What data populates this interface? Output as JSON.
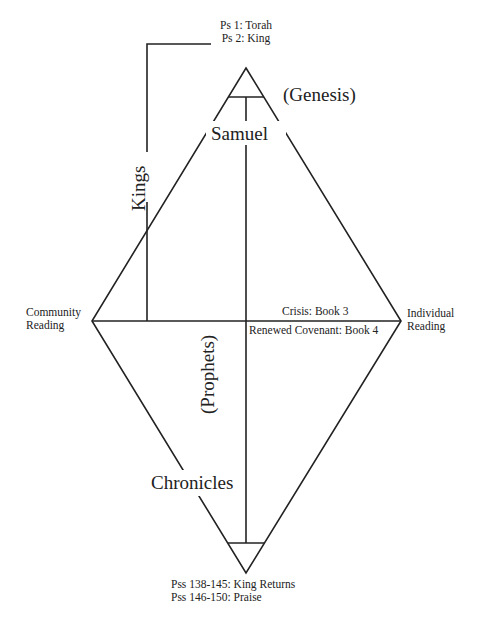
{
  "diagram": {
    "top_note": {
      "line1": "Ps 1: Torah",
      "line2": "Ps 2: King"
    },
    "bottom_note": {
      "line1": "Pss 138-145: King Returns",
      "line2": "Pss 146-150: Praise"
    },
    "left_vertex": {
      "line1": "Community",
      "line2": "Reading"
    },
    "right_vertex": {
      "line1": "Individual",
      "line2": "Reading"
    },
    "upper_axis_label": "Crisis: Book 3",
    "lower_axis_label": "Renewed Covenant: Book 4",
    "genesis": "(Genesis)",
    "samuel": "Samuel",
    "kings": "Kings",
    "prophets": "(Prophets)",
    "chronicles": "Chronicles",
    "stroke_color": "#222222"
  }
}
